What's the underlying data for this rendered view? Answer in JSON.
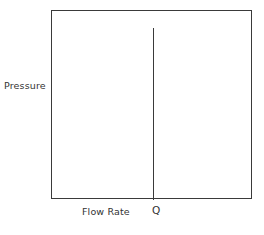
{
  "chart_data": {
    "type": "line",
    "title": "",
    "subtitle": "",
    "xlabel": "Flow Rate",
    "ylabel": "Pressure",
    "axis_tick_labels": {
      "x": [
        "Q"
      ],
      "y": []
    },
    "grid": false,
    "legend": null,
    "frame": "full-box",
    "annotations": [
      {
        "name": "vertical-asymptote",
        "label": "Q",
        "x": "Q",
        "description": "Vertical line rising from the Flow Rate axis at Q, stopping just below the top of the plot frame",
        "y_start": 0,
        "y_end": 0.9
      }
    ],
    "series": [
      {
        "name": "pressure-vs-flow-rate",
        "x": [
          "Q",
          "Q"
        ],
        "values": [
          0,
          0.9
        ]
      }
    ],
    "xlim": [
      0,
      1
    ],
    "ylim": [
      0,
      1
    ]
  },
  "figure": {
    "axes": {
      "y_label": "Pressure",
      "x_label": "Flow Rate"
    },
    "marks": {
      "q_label": "Q"
    },
    "colors": {
      "line": "#3a3a3a",
      "background": "#ffffff",
      "text": "#333333"
    }
  }
}
